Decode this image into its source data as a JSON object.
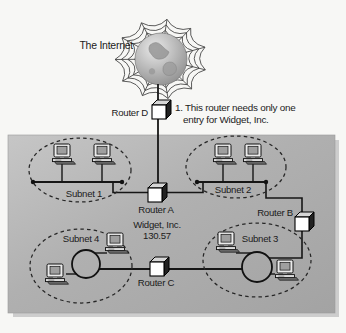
{
  "internet": {
    "label": "The Internet"
  },
  "annotation": {
    "line1": "1. This router needs only one",
    "line2": "entry for Widget, Inc."
  },
  "company": {
    "name": "Widget, Inc.",
    "network_number": "130.57"
  },
  "routers": {
    "a": {
      "label": "Router A"
    },
    "b": {
      "label": "Router B"
    },
    "c": {
      "label": "Router C"
    },
    "d": {
      "label": "Router D"
    }
  },
  "subnets": {
    "s1": {
      "label": "Subnet 1"
    },
    "s2": {
      "label": "Subnet 2"
    },
    "s3": {
      "label": "Subnet 3"
    },
    "s4": {
      "label": "Subnet 4"
    }
  },
  "colors": {
    "page_background": "#f7f7f5",
    "network_box_fill": "#aeaeae",
    "diagram_line": "#1b1b1b",
    "router_front": "#ffffff",
    "router_side": "#222222"
  }
}
